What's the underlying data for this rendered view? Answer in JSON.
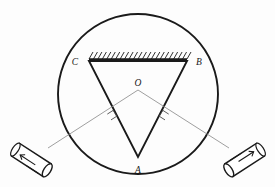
{
  "figure": {
    "background_color": "#fdfdfd",
    "ink_color": "#1a1a1a",
    "ray_color": "#8e8e8e",
    "labels": {
      "vertex_c": "C",
      "vertex_b": "B",
      "vertex_a": "A",
      "center_o": "O"
    },
    "circle": {
      "label": "spectrometer-table",
      "cx": 138,
      "cy": 94,
      "r": 80,
      "stroke_width": 1.8
    },
    "triangle": {
      "label": "prism",
      "vertex_c": {
        "x": 89,
        "y": 61
      },
      "vertex_b": {
        "x": 187,
        "y": 61
      },
      "vertex_a": {
        "x": 138,
        "y": 157
      },
      "stroke_width": 1.8
    },
    "mirror": {
      "label": "silvered-face-CB",
      "x1": 89,
      "y1": 59,
      "x2": 187,
      "y2": 59,
      "hatch_count": 22,
      "hatch_height": 7,
      "hatch_slant": 4
    },
    "center_point": {
      "x": 138,
      "y": 88
    },
    "rays": [
      {
        "name": "ray-left",
        "from": {
          "x": 138,
          "y": 90
        },
        "to": {
          "x": 48,
          "y": 148
        },
        "right_angle_at": {
          "x": 113,
          "y": 117
        }
      },
      {
        "name": "ray-right",
        "from": {
          "x": 138,
          "y": 90
        },
        "to": {
          "x": 229,
          "y": 148
        },
        "right_angle_at": {
          "x": 163,
          "y": 117
        }
      }
    ],
    "instruments": [
      {
        "name": "collimator-left",
        "cx": 33,
        "cy": 161,
        "angle_deg": 33,
        "length": 42,
        "width": 15
      },
      {
        "name": "telescope-right",
        "cx": 243,
        "cy": 161,
        "angle_deg": 147,
        "length": 42,
        "width": 15
      }
    ]
  }
}
